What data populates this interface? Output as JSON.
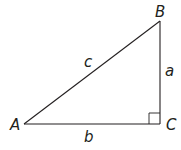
{
  "diagram": {
    "type": "right-triangle",
    "stroke_color": "#231f20",
    "vertices": {
      "A": {
        "label": "A",
        "x": 24,
        "y": 124
      },
      "B": {
        "label": "B",
        "x": 160,
        "y": 21
      },
      "C": {
        "label": "C",
        "x": 160,
        "y": 124
      }
    },
    "sides": {
      "a": {
        "label": "a",
        "between": [
          "B",
          "C"
        ]
      },
      "b": {
        "label": "b",
        "between": [
          "A",
          "C"
        ]
      },
      "c": {
        "label": "c",
        "between": [
          "A",
          "B"
        ]
      }
    },
    "right_angle_at": "C"
  }
}
